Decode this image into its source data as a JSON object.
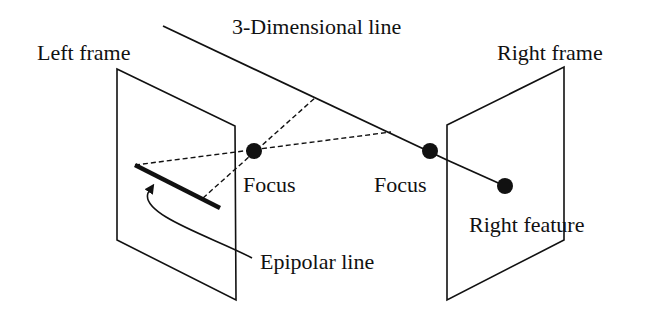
{
  "diagram": {
    "title_label": "3-Dimensional line",
    "left_frame_label": "Left frame",
    "right_frame_label": "Right frame",
    "left_focus_label": "Focus",
    "right_focus_label": "Focus",
    "right_feature_label": "Right feature",
    "epipolar_label": "Epipolar line",
    "colors": {
      "ink": "#111111",
      "background": "#ffffff"
    }
  }
}
